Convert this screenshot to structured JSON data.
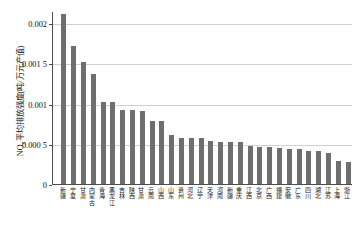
{
  "chart_data": {
    "type": "bar",
    "title": "",
    "xlabel": "",
    "ylabel": "NOx平均排放强度(吨/万元产值)",
    "ylabel_prefix": "NO",
    "ylabel_sub": "x",
    "ylabel_rest": "平均排放强度(吨/万元产值)",
    "ylim": [
      0,
      0.00215
    ],
    "grid": true,
    "legend": "none",
    "bar_color": "#6e6e6e",
    "grid_color": "#d0d0d0",
    "axis_color": "#4d4d4d",
    "ytick_labels": [
      "0.002",
      "0.001 5",
      "0.001",
      "0.000 5",
      "0"
    ],
    "ytick_values": [
      0.002,
      0.0015,
      0.001,
      0.0005,
      0
    ],
    "categories": [
      "新疆",
      "宁夏",
      "甘肃",
      "内蒙古",
      "青海",
      "黑龙江",
      "吉林",
      "陕西",
      "甘肃",
      "云南",
      "山西",
      "山东",
      "贵州",
      "河北",
      "辽宁",
      "天津",
      "河南",
      "新疆",
      "重庆",
      "江西",
      "北京",
      "广西",
      "福建",
      "安徽",
      "广东",
      "四川",
      "湖北",
      "江苏",
      "上海",
      "浙江"
    ],
    "values": [
      0.00212,
      0.00172,
      0.00152,
      0.00138,
      0.00103,
      0.00102,
      0.00093,
      0.00092,
      0.00091,
      0.00079,
      0.00079,
      0.00061,
      0.00058,
      0.00057,
      0.00057,
      0.00054,
      0.00053,
      0.00053,
      0.00052,
      0.00047,
      0.00046,
      0.00046,
      0.00045,
      0.00044,
      0.00044,
      0.00041,
      0.00041,
      0.00039,
      0.00029,
      0.00028
    ]
  }
}
